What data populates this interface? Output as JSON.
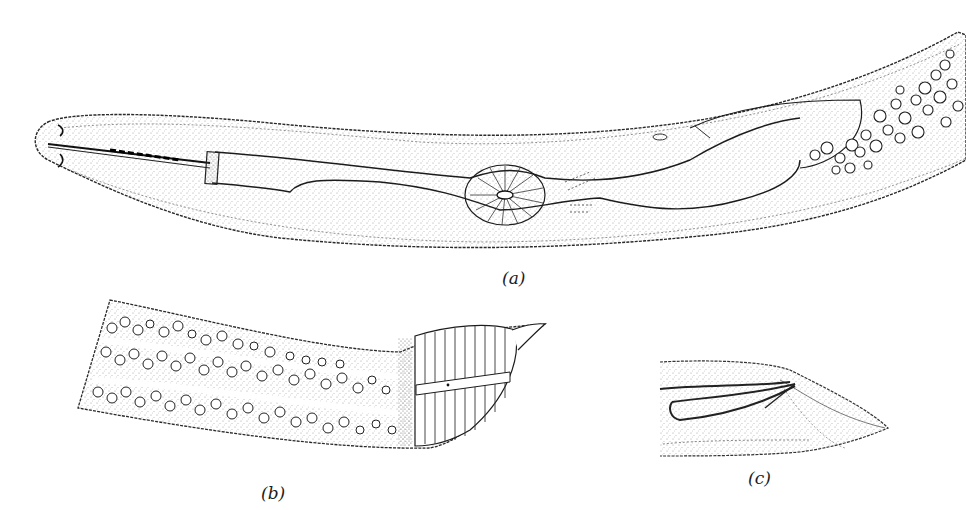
{
  "figure": {
    "panels": [
      {
        "id": "a",
        "label": "(a)",
        "subject": "anterior end of worm body"
      },
      {
        "id": "b",
        "label": "(b)",
        "subject": "posterior section with tail"
      },
      {
        "id": "c",
        "label": "(c)",
        "subject": "tail with spicules"
      }
    ],
    "caption_fragment": "",
    "colors": {
      "ink": "#1c1c1c",
      "stipple": "#8a8a8a",
      "background": "#ffffff"
    }
  }
}
